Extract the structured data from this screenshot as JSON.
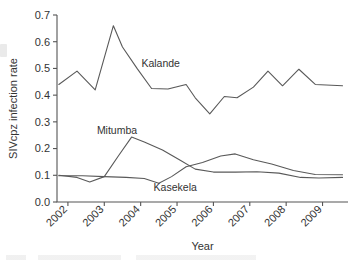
{
  "chart_data": {
    "type": "line",
    "title": "",
    "xlabel": "Year",
    "ylabel": "SIVcpz infection rate",
    "xlim": [
      2001.7,
      2009.7
    ],
    "ylim": [
      0.0,
      0.7
    ],
    "ytick_labels": [
      "0.0",
      "0.1",
      "0.2",
      "0.3",
      "0.4",
      "0.5",
      "0.6",
      "0.7"
    ],
    "ytick_values": [
      0.0,
      0.1,
      0.2,
      0.3,
      0.4,
      0.5,
      0.6,
      0.7
    ],
    "xtick_labels": [
      "2002",
      "2003",
      "2004",
      "2005",
      "2006",
      "2007",
      "2008",
      "2009"
    ],
    "xtick_values": [
      2002,
      2003,
      2004,
      2005,
      2006,
      2007,
      2008,
      2009
    ],
    "grid": false,
    "legend_position": "inline-annotations",
    "line_color": "#595959",
    "series": [
      {
        "name": "Kalande",
        "label_x": 2004.55,
        "label_y": 0.505,
        "x": [
          2001.75,
          2002.25,
          2002.75,
          2003.25,
          2003.5,
          2003.9,
          2004.3,
          2004.75,
          2005.25,
          2005.5,
          2005.9,
          2006.3,
          2006.65,
          2007.1,
          2007.5,
          2007.9,
          2008.35,
          2008.8,
          2009.55
        ],
        "y": [
          0.44,
          0.49,
          0.42,
          0.66,
          0.58,
          0.5,
          0.425,
          0.423,
          0.44,
          0.39,
          0.33,
          0.395,
          0.39,
          0.43,
          0.49,
          0.435,
          0.497,
          0.44,
          0.435
        ]
      },
      {
        "name": "Mitumba",
        "label_x": 2003.35,
        "label_y": 0.255,
        "x": [
          2001.75,
          2002.25,
          2002.6,
          2003.0,
          2003.4,
          2003.75,
          2004.1,
          2004.6,
          2005.1,
          2005.5,
          2006.0,
          2006.6,
          2007.2,
          2007.8,
          2008.4,
          2008.9,
          2009.55
        ],
        "y": [
          0.1,
          0.092,
          0.075,
          0.095,
          0.175,
          0.243,
          0.225,
          0.195,
          0.155,
          0.123,
          0.112,
          0.112,
          0.113,
          0.108,
          0.092,
          0.09,
          0.092
        ]
      },
      {
        "name": "Kasekela",
        "label_x": 2004.95,
        "label_y": 0.042,
        "x": [
          2001.75,
          2002.4,
          2003.0,
          2003.6,
          2004.1,
          2004.5,
          2004.85,
          2005.25,
          2005.7,
          2006.2,
          2006.6,
          2007.1,
          2007.6,
          2008.2,
          2008.8,
          2009.55
        ],
        "y": [
          0.098,
          0.098,
          0.095,
          0.092,
          0.088,
          0.07,
          0.095,
          0.132,
          0.148,
          0.172,
          0.18,
          0.158,
          0.142,
          0.118,
          0.103,
          0.102
        ]
      }
    ]
  }
}
